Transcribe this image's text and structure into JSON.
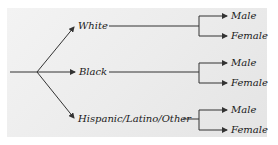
{
  "diagram": {
    "type": "tree",
    "root": "",
    "branches": [
      {
        "label": "White",
        "children": [
          "Male",
          "Female"
        ]
      },
      {
        "label": "Black",
        "children": [
          "Male",
          "Female"
        ]
      },
      {
        "label": "Hispanic/Latino/Other",
        "children": [
          "Male",
          "Female"
        ]
      }
    ]
  },
  "colors": {
    "line": "#333333",
    "text": "#1a1a1a",
    "panel": "#ececec"
  }
}
